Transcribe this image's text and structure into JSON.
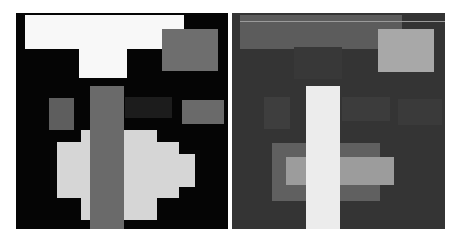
{
  "figure": {
    "panels": [
      {
        "id": "left",
        "description": "Binary-like block image, black background",
        "box": {
          "x": 16,
          "y": 13,
          "w": 212,
          "h": 216
        },
        "background": "#050505",
        "blocks": [
          {
            "name": "top-bar",
            "x": 9,
            "y": 2,
            "w": 159,
            "h": 34,
            "color": "#f8f8f8"
          },
          {
            "name": "t-stem",
            "x": 63,
            "y": 34,
            "w": 48,
            "h": 31,
            "color": "#f8f8f8"
          },
          {
            "name": "top-right-rect",
            "x": 146,
            "y": 16,
            "w": 56,
            "h": 42,
            "color": "#6e6e6e"
          },
          {
            "name": "small-left-rect",
            "x": 33,
            "y": 85,
            "w": 25,
            "h": 32,
            "color": "#5e5e5e"
          },
          {
            "name": "faint-center-rect",
            "x": 109,
            "y": 84,
            "w": 47,
            "h": 21,
            "color": "#1c1c1c"
          },
          {
            "name": "right-rect",
            "x": 166,
            "y": 87,
            "w": 42,
            "h": 24,
            "color": "#6a6a6a"
          },
          {
            "name": "blob-row-1",
            "x": 65,
            "y": 117,
            "w": 76,
            "h": 12,
            "color": "#d6d6d6"
          },
          {
            "name": "blob-row-2",
            "x": 41,
            "y": 129,
            "w": 122,
            "h": 12,
            "color": "#d6d6d6"
          },
          {
            "name": "blob-row-3",
            "x": 41,
            "y": 141,
            "w": 138,
            "h": 33,
            "color": "#d6d6d6"
          },
          {
            "name": "blob-row-4",
            "x": 41,
            "y": 174,
            "w": 122,
            "h": 11,
            "color": "#d6d6d6"
          },
          {
            "name": "blob-row-5",
            "x": 65,
            "y": 185,
            "w": 76,
            "h": 22,
            "color": "#d6d6d6"
          },
          {
            "name": "center-bar",
            "x": 74,
            "y": 73,
            "w": 34,
            "h": 143,
            "color": "#6a6a6a"
          }
        ]
      },
      {
        "id": "right",
        "description": "Reconstructed block image, dark gray background",
        "box": {
          "x": 232,
          "y": 13,
          "w": 213,
          "h": 216
        },
        "background": "#343434",
        "blocks": [
          {
            "name": "top-bar",
            "x": 8,
            "y": 2,
            "w": 162,
            "h": 34,
            "color": "#5c5c5c"
          },
          {
            "name": "top-bar-highlight",
            "x": 8,
            "y": 8,
            "w": 205,
            "h": 1,
            "color": "#9a9a9a"
          },
          {
            "name": "t-stem",
            "x": 62,
            "y": 34,
            "w": 48,
            "h": 32,
            "color": "#383838"
          },
          {
            "name": "top-right-rect",
            "x": 146,
            "y": 16,
            "w": 56,
            "h": 43,
            "color": "#a8a8a8"
          },
          {
            "name": "small-left-rect",
            "x": 32,
            "y": 84,
            "w": 26,
            "h": 32,
            "color": "#3e3e3e"
          },
          {
            "name": "faint-center-rect",
            "x": 110,
            "y": 84,
            "w": 48,
            "h": 24,
            "color": "#3c3c3c"
          },
          {
            "name": "right-rect",
            "x": 166,
            "y": 86,
            "w": 44,
            "h": 26,
            "color": "#3a3a3a"
          },
          {
            "name": "cross-outer",
            "x": 40,
            "y": 130,
            "w": 108,
            "h": 58,
            "color": "#606060"
          },
          {
            "name": "cross-inner",
            "x": 54,
            "y": 144,
            "w": 108,
            "h": 28,
            "color": "#9c9c9c"
          },
          {
            "name": "center-bar",
            "x": 74,
            "y": 73,
            "w": 34,
            "h": 143,
            "color": "#ececec"
          }
        ]
      }
    ]
  }
}
